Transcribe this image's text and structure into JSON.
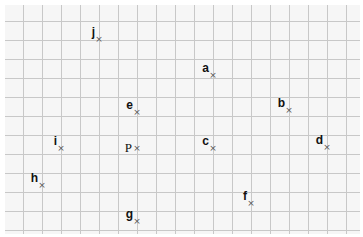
{
  "diagram": {
    "type": "labeled points on square grid",
    "grid": {
      "origin_x": 23,
      "origin_y": 21,
      "spacing": 19,
      "columns": 18,
      "rows": 12,
      "background": "#f6f6f6",
      "line_color": "#c8c8c8"
    },
    "points": [
      {
        "label": "j",
        "x": 99,
        "y": 39,
        "style": "bold"
      },
      {
        "label": "a",
        "x": 213,
        "y": 75,
        "style": "bold"
      },
      {
        "label": "e",
        "x": 137,
        "y": 112,
        "style": "bold"
      },
      {
        "label": "b",
        "x": 289,
        "y": 110,
        "style": "bold"
      },
      {
        "label": "i",
        "x": 61,
        "y": 148,
        "style": "bold"
      },
      {
        "label": "P",
        "x": 137,
        "y": 148,
        "style": "serif"
      },
      {
        "label": "c",
        "x": 213,
        "y": 148,
        "style": "bold"
      },
      {
        "label": "d",
        "x": 327,
        "y": 147,
        "style": "bold"
      },
      {
        "label": "h",
        "x": 42,
        "y": 185,
        "style": "bold"
      },
      {
        "label": "f",
        "x": 251,
        "y": 203,
        "style": "bold"
      },
      {
        "label": "g",
        "x": 137,
        "y": 221,
        "style": "bold"
      }
    ],
    "marker_glyph": "×"
  }
}
